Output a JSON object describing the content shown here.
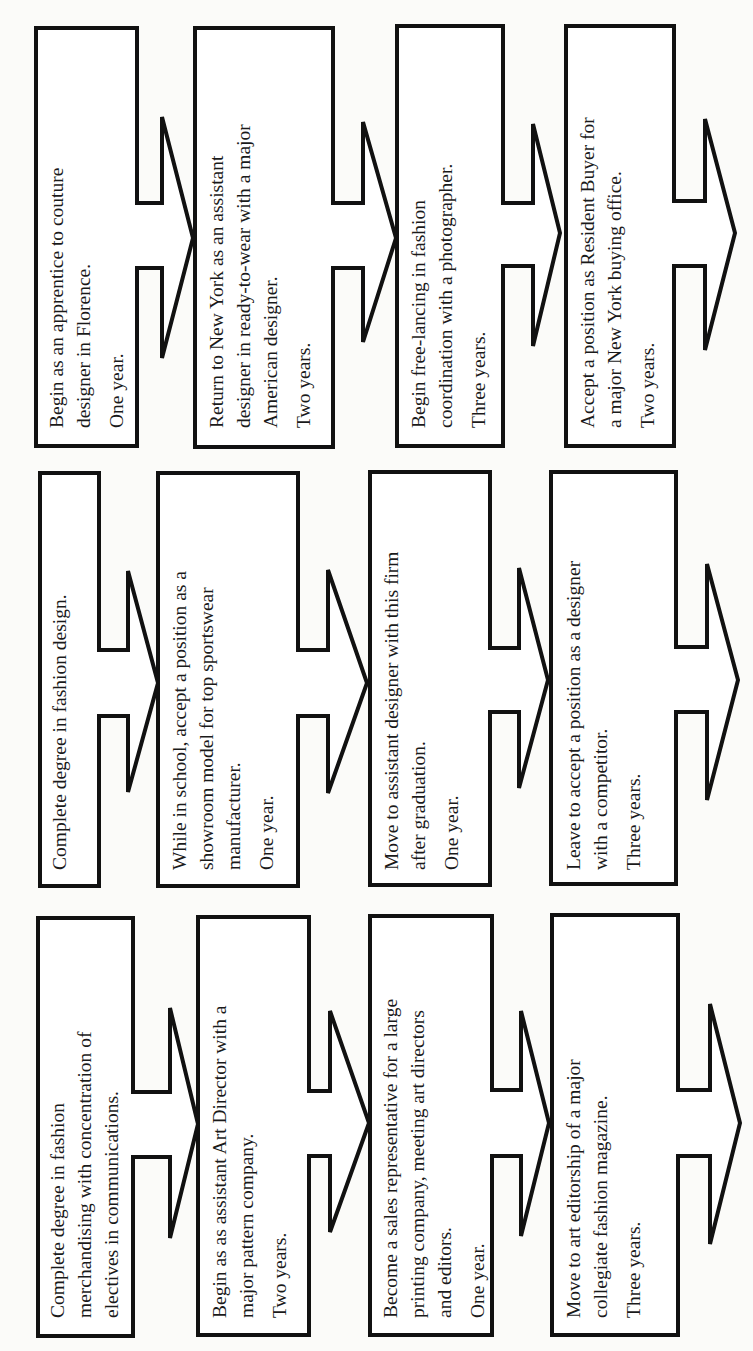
{
  "diagram": {
    "orientation": "rotated-90-ccw",
    "columns": [
      {
        "name": "path-1",
        "steps": [
          {
            "lines": [
              "Begin as an apprentice to couture",
              "designer in Florence."
            ],
            "duration": "One year."
          },
          {
            "lines": [
              "Return to New York as an assistant",
              "designer in ready-to-wear with a major",
              "American designer."
            ],
            "duration": "Two years."
          },
          {
            "lines": [
              "Begin free-lancing in fashion",
              "coordination with a photographer."
            ],
            "duration": "Three years."
          },
          {
            "lines": [
              "Accept a position as Resident Buyer for",
              "a major New York buying office."
            ],
            "duration": "Two years."
          }
        ]
      },
      {
        "name": "path-2",
        "steps": [
          {
            "lines": [
              "Complete degree in fashion design."
            ],
            "duration": ""
          },
          {
            "lines": [
              "While in school, accept a position as a",
              "showroom model for top sportswear",
              "manufacturer."
            ],
            "duration": "One year."
          },
          {
            "lines": [
              "Move to assistant designer with this firm",
              "after graduation."
            ],
            "duration": "One year."
          },
          {
            "lines": [
              "Leave to accept a position as a designer",
              "with a competitor."
            ],
            "duration": "Three years."
          }
        ]
      },
      {
        "name": "path-3",
        "steps": [
          {
            "lines": [
              "Complete degree in fashion",
              "merchandising with concentration of",
              "electives in communications."
            ],
            "duration": ""
          },
          {
            "lines": [
              "Begin as as assistant Art Director with a",
              "major pattern company."
            ],
            "duration": "Two years."
          },
          {
            "lines": [
              "Become a sales representative for a large",
              "printing company, meeting art directors",
              "and editors."
            ],
            "duration": "One year."
          },
          {
            "lines": [
              "Move to art editorship of a major",
              "collegiate fashion magazine."
            ],
            "duration": "Three years."
          }
        ]
      }
    ]
  }
}
